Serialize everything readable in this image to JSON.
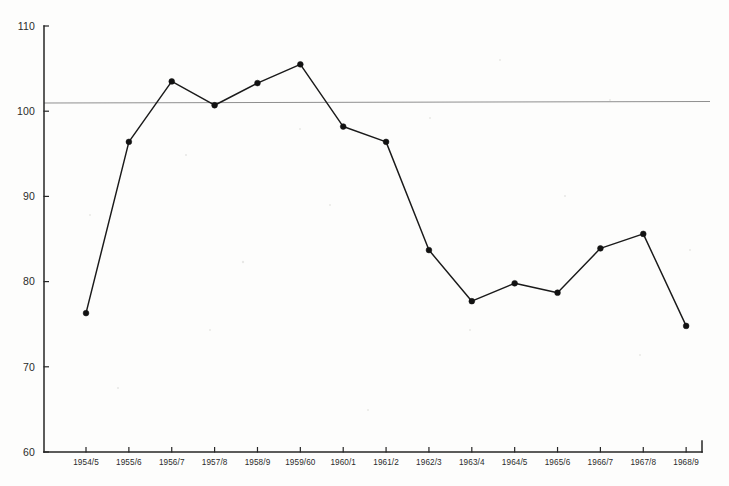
{
  "chart_data": {
    "type": "line",
    "title": "",
    "subtitle": "",
    "xlabel": "",
    "ylabel": "",
    "categories": [
      "1954/5",
      "1955/6",
      "1956/7",
      "1957/8",
      "1958/9",
      "1959/60",
      "1960/1",
      "1961/2",
      "1962/3",
      "1963/4",
      "1964/5",
      "1965/6",
      "1966/7",
      "1967/8",
      "1968/9"
    ],
    "values": [
      76.3,
      96.4,
      103.5,
      100.7,
      103.3,
      105.5,
      98.2,
      96.4,
      83.7,
      77.7,
      79.8,
      78.7,
      83.9,
      85.6,
      74.8
    ],
    "series": [
      {
        "name": "index",
        "values": [
          76.3,
          96.4,
          103.5,
          100.7,
          103.3,
          105.5,
          98.2,
          96.4,
          83.7,
          77.7,
          79.8,
          78.7,
          83.9,
          85.6,
          74.8
        ]
      }
    ],
    "ylim": [
      60,
      110
    ],
    "y_ticks": [
      60,
      70,
      80,
      90,
      100,
      110
    ],
    "y_tick_labels": [
      "60",
      "70",
      "80",
      "90",
      "100",
      "110"
    ],
    "grid": false,
    "legend": "none",
    "annotations": [
      {
        "name": "reference-line",
        "type": "hline",
        "value": 100,
        "color": "#8f8f8f"
      }
    ],
    "colors": {
      "line": "#1a1a1a",
      "marker": "#121212",
      "axis": "#262626",
      "reference": "#8f8f8f",
      "background": "#fdfdfc"
    }
  }
}
